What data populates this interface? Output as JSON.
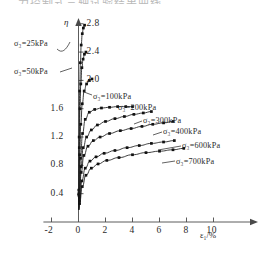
{
  "figure": {
    "partial_top_text": "二 力控制式三轴试验结果曲线",
    "y_axis_symbol": "η",
    "x_axis_label": "ε₁/%"
  },
  "chart_data": {
    "type": "line",
    "title": "",
    "xlabel": "ε₁/%",
    "ylabel": "η",
    "xlim": [
      -2.6,
      11.8
    ],
    "ylim": [
      0.15,
      3.0
    ],
    "xticks": [
      -2,
      0,
      2,
      4,
      6,
      8,
      10
    ],
    "xticklabels": [
      "-2",
      "0",
      "2",
      "4",
      "6",
      "8",
      "10"
    ],
    "yticks": [
      0.4,
      0.8,
      1.2,
      1.6,
      2.0,
      2.4,
      2.8
    ],
    "yticklabels": [
      "0.4",
      "0.8",
      "1.2",
      "1.6",
      "2.0",
      "2.4",
      "2.8"
    ],
    "grid": false,
    "legend_position": "inline-annotations",
    "marker": "filled-square",
    "series": [
      {
        "name": "σ₃=25kPa",
        "label": "σ₃=25kPa",
        "confining_pressure_kpa": 25,
        "x": [
          0.02,
          0.05,
          0.09,
          0.14,
          0.2,
          0.28,
          0.36,
          0.45
        ],
        "y": [
          0.45,
          1.2,
          1.85,
          2.25,
          2.5,
          2.66,
          2.74,
          2.78
        ]
      },
      {
        "name": "σ₃=50kPa",
        "label": "σ₃=50kPa",
        "confining_pressure_kpa": 50,
        "x": [
          0.02,
          0.06,
          0.11,
          0.17,
          0.25,
          0.34,
          0.44,
          0.55
        ],
        "y": [
          0.4,
          1.05,
          1.6,
          1.95,
          2.18,
          2.3,
          2.37,
          2.4
        ]
      },
      {
        "name": "σ₃=100kPa",
        "label": "σ₃=100kPa",
        "confining_pressure_kpa": 100,
        "x": [
          0.03,
          0.09,
          0.17,
          0.28,
          0.42,
          0.6,
          0.8,
          1.0
        ],
        "y": [
          0.38,
          0.95,
          1.38,
          1.67,
          1.85,
          1.95,
          2.0,
          2.02
        ]
      },
      {
        "name": "σ₃=200kPa",
        "label": "σ₃=200kPa",
        "confining_pressure_kpa": 200,
        "x": [
          0.05,
          0.15,
          0.3,
          0.5,
          0.8,
          1.2,
          1.7,
          2.3,
          2.9,
          3.5,
          4.0
        ],
        "y": [
          0.38,
          0.9,
          1.25,
          1.45,
          1.55,
          1.59,
          1.61,
          1.62,
          1.63,
          1.63,
          1.63
        ]
      },
      {
        "name": "σ₃=300kPa",
        "label": "σ₃=300kPa",
        "confining_pressure_kpa": 300,
        "x": [
          0.06,
          0.18,
          0.35,
          0.6,
          0.95,
          1.4,
          2.0,
          2.7,
          3.4,
          4.1,
          4.8,
          5.4
        ],
        "y": [
          0.36,
          0.78,
          1.05,
          1.2,
          1.3,
          1.37,
          1.42,
          1.46,
          1.49,
          1.52,
          1.54,
          1.56
        ]
      },
      {
        "name": "σ₃=400kPa",
        "label": "σ₃=400kPa",
        "confining_pressure_kpa": 400,
        "x": [
          0.07,
          0.2,
          0.4,
          0.7,
          1.1,
          1.6,
          2.3,
          3.1,
          3.9,
          4.7,
          5.5,
          6.3,
          7.0
        ],
        "y": [
          0.34,
          0.7,
          0.94,
          1.07,
          1.15,
          1.2,
          1.25,
          1.29,
          1.32,
          1.35,
          1.38,
          1.4,
          1.42
        ]
      },
      {
        "name": "σ₃=600kPa",
        "label": "σ₃=600kPa",
        "confining_pressure_kpa": 600,
        "x": [
          0.08,
          0.25,
          0.5,
          0.85,
          1.3,
          1.9,
          2.7,
          3.6,
          4.5,
          5.4,
          6.3,
          7.1
        ],
        "y": [
          0.3,
          0.58,
          0.76,
          0.86,
          0.92,
          0.97,
          1.01,
          1.05,
          1.08,
          1.11,
          1.13,
          1.15
        ]
      },
      {
        "name": "σ₃=700kPa",
        "label": "σ₃=700kPa",
        "confining_pressure_kpa": 700,
        "x": [
          0.08,
          0.28,
          0.55,
          0.95,
          1.45,
          2.1,
          3.0,
          4.0,
          5.0,
          6.0,
          7.0,
          7.8
        ],
        "y": [
          0.26,
          0.5,
          0.66,
          0.76,
          0.82,
          0.87,
          0.91,
          0.95,
          0.98,
          1.0,
          1.02,
          1.04
        ]
      }
    ]
  },
  "annotations": [
    {
      "id": "ann-25",
      "text": "σ₃=25kPa",
      "left": 14,
      "top": 40
    },
    {
      "id": "ann-50",
      "text": "σ₃=50kPa",
      "left": 14,
      "top": 68
    },
    {
      "id": "ann-100",
      "text": "σ₃=100kPa",
      "left": 93,
      "top": 93
    },
    {
      "id": "ann-200",
      "text": "σ₃=200kPa",
      "left": 118,
      "top": 104
    },
    {
      "id": "ann-300",
      "text": "σ₃=300kPa",
      "left": 143,
      "top": 117
    },
    {
      "id": "ann-400",
      "text": "σ₃=400kPa",
      "left": 163,
      "top": 128
    },
    {
      "id": "ann-600",
      "text": "σ₃=600kPa",
      "left": 182,
      "top": 142
    },
    {
      "id": "ann-700",
      "text": "σ₃=700kPa",
      "left": 176,
      "top": 158
    }
  ]
}
